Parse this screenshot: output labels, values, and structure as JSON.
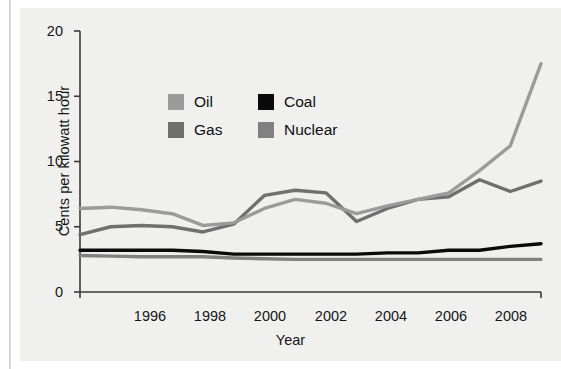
{
  "chart_data": {
    "type": "line",
    "title": "",
    "xlabel": "Year",
    "ylabel": "Cents per kilowatt hour",
    "xlim": [
      1994,
      2009
    ],
    "ylim": [
      0,
      20
    ],
    "yticks": [
      0,
      5,
      10,
      15,
      20
    ],
    "xticks": [
      1996,
      1998,
      2000,
      2002,
      2004,
      2006,
      2008
    ],
    "grid": false,
    "legend_position": "upper-center",
    "x": [
      1994,
      1995,
      1996,
      1997,
      1998,
      1999,
      2000,
      2001,
      2002,
      2003,
      2004,
      2005,
      2006,
      2007,
      2008,
      2009
    ],
    "series": [
      {
        "name": "Oil",
        "color": "#9b9b9b",
        "values": [
          6.4,
          6.5,
          6.3,
          6.0,
          5.1,
          5.3,
          6.4,
          7.1,
          6.8,
          6.0,
          6.6,
          7.1,
          7.6,
          9.3,
          11.2,
          17.5
        ]
      },
      {
        "name": "Gas",
        "color": "#6f6f6f",
        "values": [
          4.4,
          5.0,
          5.1,
          5.0,
          4.6,
          5.2,
          7.4,
          7.8,
          7.6,
          5.4,
          6.4,
          7.1,
          7.3,
          8.6,
          7.7,
          8.5
        ]
      },
      {
        "name": "Coal",
        "color": "#0a0a0a",
        "values": [
          3.2,
          3.2,
          3.2,
          3.2,
          3.1,
          2.9,
          2.9,
          2.9,
          2.9,
          2.9,
          3.0,
          3.0,
          3.2,
          3.2,
          3.5,
          3.7
        ]
      },
      {
        "name": "Nuclear",
        "color": "#818181",
        "values": [
          2.8,
          2.75,
          2.7,
          2.7,
          2.7,
          2.6,
          2.55,
          2.5,
          2.5,
          2.5,
          2.5,
          2.5,
          2.5,
          2.5,
          2.5,
          2.5
        ]
      }
    ],
    "legend": [
      {
        "label": "Oil",
        "color": "#9b9b9b"
      },
      {
        "label": "Coal",
        "color": "#0a0a0a"
      },
      {
        "label": "Gas",
        "color": "#6f6f6f"
      },
      {
        "label": "Nuclear",
        "color": "#818181"
      }
    ]
  },
  "axis": {
    "line_color": "#3a3a3a",
    "y_tick_labels": [
      "20",
      "15",
      "10",
      "5",
      "0"
    ],
    "x_tick_labels": [
      "1996",
      "1998",
      "2000",
      "2002",
      "2004",
      "2006",
      "2008"
    ],
    "y_title": "Cents per kilowatt hour",
    "x_title": "Year"
  },
  "panel": {
    "background": "#f0f0ef"
  }
}
